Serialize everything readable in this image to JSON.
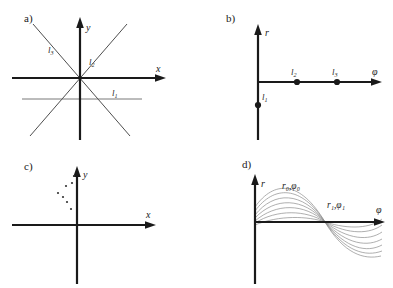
{
  "figure": {
    "width": 393,
    "height": 288,
    "background": "#ffffff",
    "stroke_color": "#1a1a1a",
    "curve_color": "#888888",
    "dot_color": "#333333"
  },
  "panels": [
    {
      "id": "a",
      "label": "a)",
      "type": "cartesian-lines",
      "axes": {
        "x_label": "x",
        "y_label": "y"
      },
      "lines": [
        {
          "name": "l1",
          "label": "l",
          "sub": "1",
          "kind": "horizontal-offset"
        },
        {
          "name": "l2",
          "label": "l",
          "sub": "2",
          "kind": "diagonal-up-right"
        },
        {
          "name": "l3",
          "label": "l",
          "sub": "3",
          "kind": "diagonal-up-left"
        }
      ]
    },
    {
      "id": "b",
      "label": "b)",
      "type": "hough-points",
      "axes": {
        "x_label": "φ",
        "y_label": "r"
      },
      "points": [
        {
          "name": "l1",
          "label": "l",
          "sub": "1",
          "x": 0,
          "y": -0.3
        },
        {
          "name": "l2",
          "label": "l",
          "sub": "2",
          "x": 0.31,
          "y": 0
        },
        {
          "name": "l3",
          "label": "l",
          "sub": "3",
          "x": 0.63,
          "y": 0
        }
      ]
    },
    {
      "id": "c",
      "label": "c)",
      "type": "cartesian-points",
      "axes": {
        "x_label": "x",
        "y_label": "y"
      },
      "dot_count": 7
    },
    {
      "id": "d",
      "label": "d)",
      "type": "hough-sinusoids",
      "axes": {
        "x_label": "φ",
        "y_label": "r"
      },
      "annotations": [
        {
          "name": "r0-phi0",
          "text": "r₀,φ₀"
        },
        {
          "name": "r1-phi1",
          "text": "r₁,φ₁"
        }
      ],
      "curve_count": 7
    }
  ]
}
